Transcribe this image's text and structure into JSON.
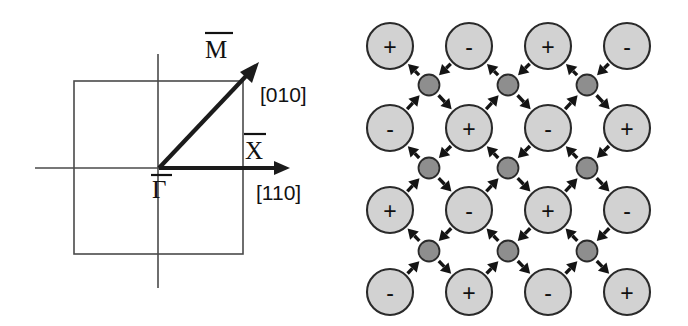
{
  "figure": {
    "panels": [
      "surface-brillouin-zone",
      "surface-lattice-displacement"
    ],
    "background_color": "#ffffff"
  },
  "brillouin_zone": {
    "square": {
      "x0": 74,
      "y0": 81,
      "x1": 243,
      "y1": 254
    },
    "origin": {
      "x": 159,
      "y": 168
    },
    "axis_horizontal": {
      "x_start": 35,
      "x_end": 288,
      "y": 168
    },
    "axis_vertical": {
      "x": 158,
      "y_start": 54,
      "y_end": 288
    },
    "gamma_to_x_arrow": {
      "x0": 159,
      "y0": 168,
      "x1": 286,
      "y1": 168
    },
    "gamma_to_m_arrow": {
      "x0": 159,
      "y0": 168,
      "x1": 258,
      "y1": 64
    },
    "labels": {
      "gamma": "Γ",
      "x_point": "X",
      "m_point": "M",
      "direction_vertical": "[010]",
      "direction_horizontal": "[110]"
    },
    "label_positions": {
      "gamma": {
        "x": 152,
        "y": 196
      },
      "x_point": {
        "x": 245,
        "y": 159
      },
      "m_point": {
        "x": 206,
        "y": 57
      },
      "direction_vertical": {
        "x": 261,
        "y": 101
      },
      "direction_horizontal": {
        "x": 257,
        "y": 200
      }
    },
    "stroke_colors": {
      "square": "#4a4a4a",
      "axis": "#4a4a4a",
      "arrow": "#1b1b1b",
      "text": "#121212"
    }
  },
  "lattice": {
    "big_ion_radius": 23,
    "small_ion_radius": 10.5,
    "big_ion_fill": "#d2d2d2",
    "small_ion_fill": "#8e8e8e",
    "outline_color": "#2a2a2a",
    "arrow_color": "#141414",
    "column_x": [
      46,
      125,
      204,
      283
    ],
    "row_y": [
      46,
      128,
      210,
      292
    ],
    "small_column_x": [
      85,
      164,
      243
    ],
    "small_row_y": [
      85,
      168,
      251
    ],
    "rows": [
      {
        "row": 0,
        "signs": [
          "+",
          "-",
          "+",
          "-"
        ]
      },
      {
        "row": 1,
        "signs": [
          "-",
          "+",
          "-",
          "+"
        ]
      },
      {
        "row": 2,
        "signs": [
          "+",
          "-",
          "+",
          "-"
        ]
      },
      {
        "row": 3,
        "signs": [
          "-",
          "+",
          "-",
          "+"
        ]
      }
    ],
    "small_ion_grid": [
      {
        "row": 0,
        "count": 3
      },
      {
        "row": 1,
        "count": 3
      },
      {
        "row": 2,
        "count": 3
      }
    ],
    "displacement_pattern": {
      "description": "double-headed arrows between each small interstitial ion and its four neighbouring large ions",
      "outward_diagonals": [
        "up-left",
        "down-right"
      ],
      "inward_diagonals": [
        "up-right",
        "down-left"
      ]
    }
  }
}
